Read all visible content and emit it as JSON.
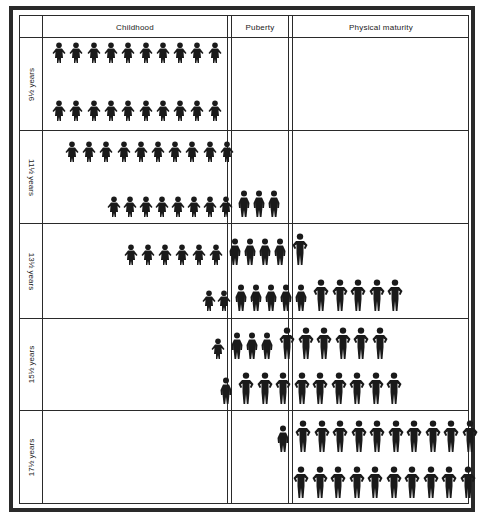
{
  "diagram": {
    "type": "pictogram-table",
    "columns": [
      {
        "id": "label",
        "label": ""
      },
      {
        "id": "childhood",
        "label": "Childhood"
      },
      {
        "id": "puberty",
        "label": "Puberty"
      },
      {
        "id": "maturity",
        "label": "Physical maturity"
      }
    ],
    "rows": [
      {
        "label": "9½ years",
        "flipped": false,
        "lines": [
          {
            "row": "top",
            "figures": [
              {
                "stage": "child",
                "count": 10
              }
            ]
          },
          {
            "row": "bottom",
            "figures": [
              {
                "stage": "child",
                "count": 10
              }
            ]
          }
        ]
      },
      {
        "label": "11½ years",
        "flipped": true,
        "lines": [
          {
            "row": "top",
            "figures": [
              {
                "stage": "child",
                "count": 10
              }
            ]
          },
          {
            "row": "bottom",
            "figures": [
              {
                "stage": "child",
                "count": 8
              },
              {
                "stage": "puberty",
                "count": 3
              }
            ]
          }
        ]
      },
      {
        "label": "13½ years",
        "flipped": true,
        "lines": [
          {
            "row": "top",
            "figures": [
              {
                "stage": "child",
                "count": 6
              },
              {
                "stage": "puberty",
                "count": 4
              },
              {
                "stage": "adult",
                "count": 1
              }
            ]
          },
          {
            "row": "bottom",
            "figures": [
              {
                "stage": "child",
                "count": 2
              },
              {
                "stage": "puberty",
                "count": 5
              },
              {
                "stage": "adult",
                "count": 5
              }
            ]
          }
        ]
      },
      {
        "label": "15½ years",
        "flipped": false,
        "lines": [
          {
            "row": "top",
            "figures": [
              {
                "stage": "child",
                "count": 1
              },
              {
                "stage": "puberty",
                "count": 3
              },
              {
                "stage": "adult",
                "count": 6
              }
            ]
          },
          {
            "row": "bottom",
            "figures": [
              {
                "stage": "puberty",
                "count": 1
              },
              {
                "stage": "adult",
                "count": 9
              }
            ]
          }
        ]
      },
      {
        "label": "17½ years",
        "flipped": false,
        "lines": [
          {
            "row": "top",
            "figures": [
              {
                "stage": "puberty",
                "count": 1
              },
              {
                "stage": "adult",
                "count": 10
              }
            ]
          },
          {
            "row": "bottom",
            "figures": [
              {
                "stage": "adult",
                "count": 10
              }
            ]
          }
        ]
      }
    ],
    "figure_color": "#1a1a1a",
    "line_color": "#2a2a2a"
  }
}
